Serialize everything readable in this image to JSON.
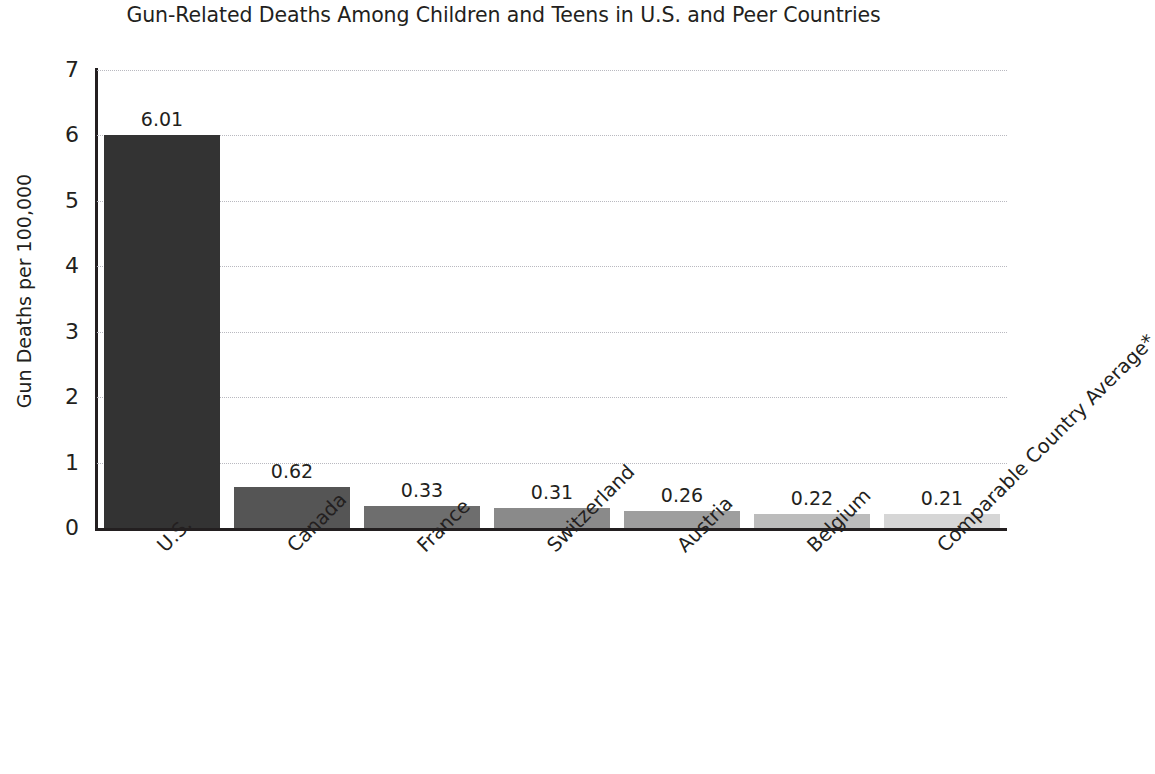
{
  "chart_data": {
    "type": "bar",
    "title": "Gun-Related Deaths Among Children and Teens in U.S. and Peer Countries",
    "xlabel": "",
    "ylabel": "Gun Deaths per 100,000",
    "categories": [
      "U.S.",
      "Canada",
      "France",
      "Switzerland",
      "Austria",
      "Belgium",
      "Comparable Country Average*"
    ],
    "values": [
      6.01,
      0.62,
      0.33,
      0.31,
      0.26,
      0.22,
      0.21
    ],
    "value_labels": [
      "6.01",
      "0.62",
      "0.33",
      "0.31",
      "0.26",
      "0.22",
      "0.21"
    ],
    "bar_colors": [
      "#333333",
      "#555555",
      "#6e6e6e",
      "#8a8a8a",
      "#9e9e9e",
      "#bcbcbc",
      "#d6d6d6"
    ],
    "ylim": [
      0,
      7
    ],
    "yticks": [
      0,
      1,
      2,
      3,
      4,
      5,
      6,
      7
    ],
    "ytick_labels": [
      "0",
      "1",
      "2",
      "3",
      "4",
      "5",
      "6",
      "7"
    ],
    "grid": "horizontal-dotted",
    "legend": "none",
    "xtick_label_rotation": -45,
    "axis_color": "#231f20",
    "gridline_color": "#b9b9c0",
    "background_color": "#ffffff"
  }
}
